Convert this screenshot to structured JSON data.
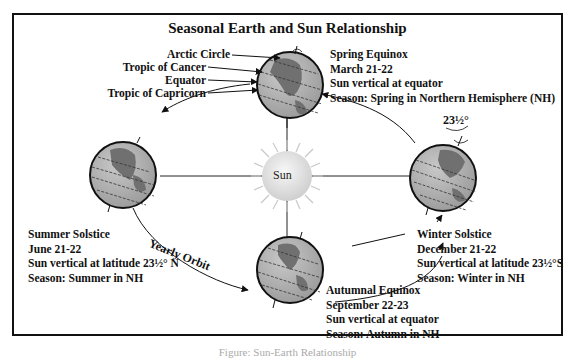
{
  "title": "Seasonal Earth and Sun Relationship",
  "sun_label": "Sun",
  "orbit_label": "Yearly Orbit",
  "tilt_label": "23½°",
  "latitude_lines": {
    "arctic": "Arctic Circle",
    "cancer": "Tropic of Cancer",
    "equator": "Equator",
    "capricorn": "Tropic of Capricorn"
  },
  "seasons": {
    "spring": {
      "name": "Spring Equinox",
      "date": "March 21-22",
      "sun": "Sun vertical at equator",
      "season": "Season:  Spring in Northern Hemisphere (NH)"
    },
    "summer": {
      "name": "Summer Solstice",
      "date": "June 21-22",
      "sun": "Sun vertical at latitude 23½° N",
      "season": "Season:  Summer in NH"
    },
    "autumn": {
      "name": "Autumnal Equinox",
      "date": "September 22-23",
      "sun": "Sun vertical at equator",
      "season": "Season:  Autumn in NH"
    },
    "winter": {
      "name": "Winter Solstice",
      "date": "December 21-22",
      "sun": "Sun vertical at latitude 23½°S",
      "season": "Season:  Winter in NH"
    }
  },
  "caption": "Figure: Sun-Earth Relationship",
  "colors": {
    "earth": "#9a9a9a",
    "land": "#6e6e6e",
    "sun": "#e8e8e8",
    "line": "#111111"
  }
}
